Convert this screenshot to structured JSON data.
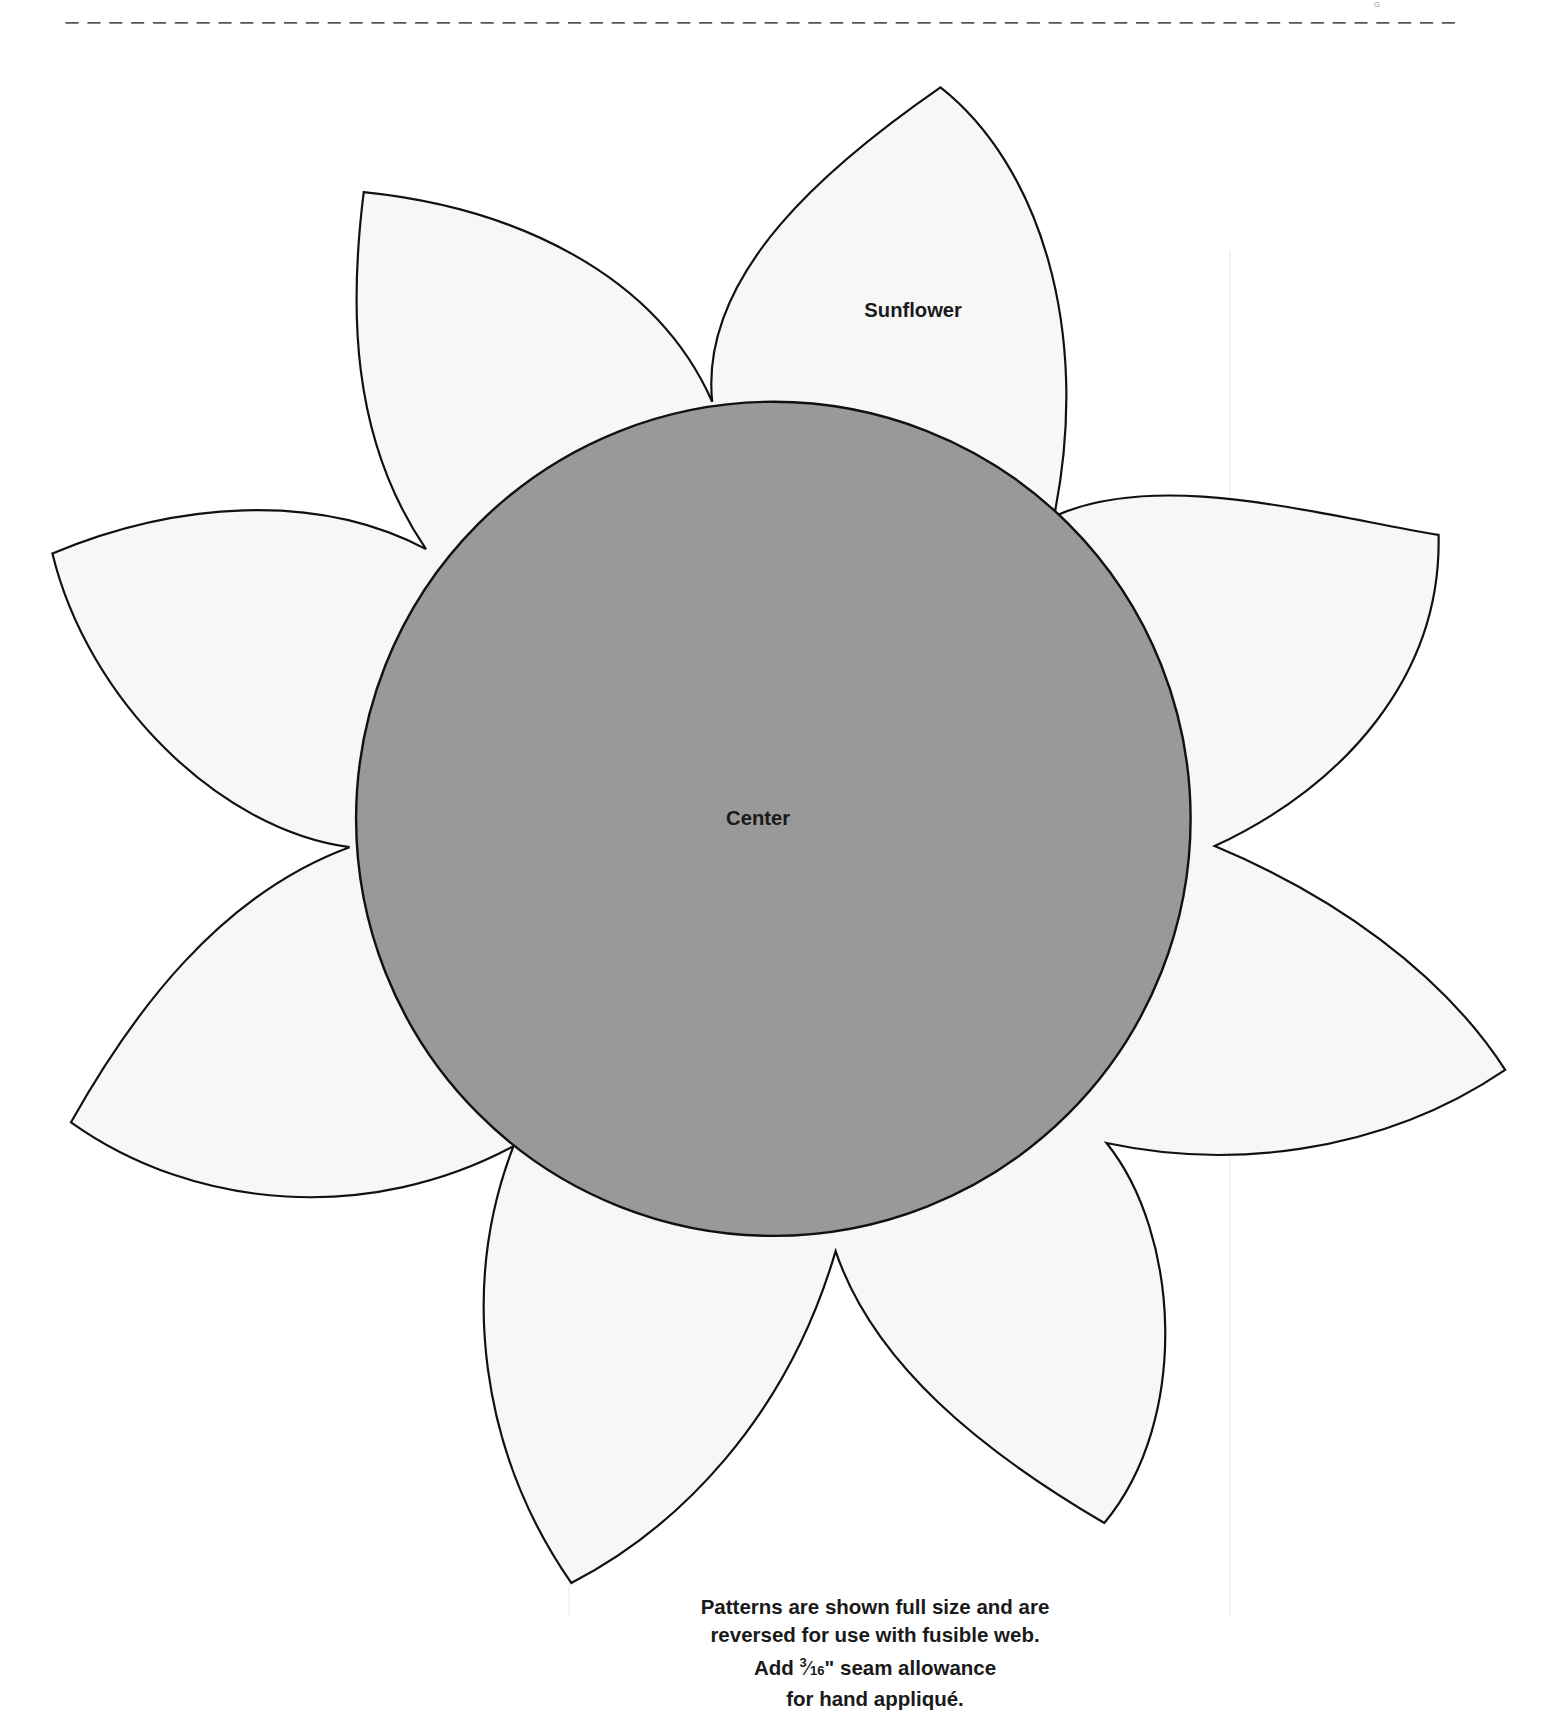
{
  "page": {
    "background": "#ffffff",
    "cut_line": {
      "style": "dashed",
      "color": "#555555"
    }
  },
  "pattern": {
    "title": "Sunflower",
    "center_label": "Center",
    "petal_count": 9,
    "colors": {
      "petal_fill": "#f7f7f7",
      "center_fill": "#999999",
      "outline": "#111111",
      "page_seam": "#e6e6e6"
    }
  },
  "instructions": {
    "line1": "Patterns are shown full size and are",
    "line2": "reversed for use with fusible web.",
    "line3_prefix": "Add",
    "fraction_numerator": "3",
    "fraction_slash": "⁄",
    "fraction_denominator": "16",
    "line3_suffix": "\" seam allowance",
    "line4": "for hand appliqué."
  }
}
